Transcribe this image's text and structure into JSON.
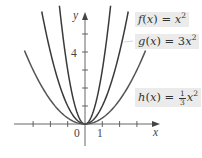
{
  "chart_data": {
    "type": "line",
    "title": "",
    "xlabel": "x",
    "ylabel": "y",
    "x_tick_labels": [
      "0",
      "1"
    ],
    "y_tick_labels": [
      "4"
    ],
    "x_ticks": [
      -3,
      -2,
      -1,
      0,
      1,
      2,
      3
    ],
    "y_ticks": [
      1,
      2,
      3,
      4,
      5
    ],
    "xlim": [
      -3.7,
      4.1
    ],
    "ylim": [
      -1,
      6.2
    ],
    "grid": false,
    "legend_position": "inline-labels-right",
    "series": [
      {
        "name": "f(x) = x^2",
        "formula": "x^2",
        "coef": 1,
        "x_range": [
          -2.5,
          2.5
        ],
        "color": "#3a3a3a",
        "label_text": {
          "fn": "f",
          "arg": "x",
          "rhs": "x",
          "exp": "2"
        }
      },
      {
        "name": "g(x) = 3x^2",
        "formula": "3x^2",
        "coef": 3,
        "x_range": [
          -1.48,
          1.48
        ],
        "color": "#3a3a3a",
        "label_text": {
          "fn": "g",
          "arg": "x",
          "rhs": "3x",
          "exp": "2"
        }
      },
      {
        "name": "h(x) = (1/3)x^2",
        "formula": "(1/3)x^2",
        "coef": 0.3333,
        "x_range": [
          -3.5,
          3.5
        ],
        "color": "#555555",
        "label_text": {
          "fn": "h",
          "arg": "x",
          "frac_num": "1",
          "frac_den": "3",
          "rhs": "x",
          "exp": "2"
        }
      }
    ]
  },
  "axes": {
    "x_label": "x",
    "y_label": "y",
    "origin_label": "0",
    "x_one_label": "1",
    "y_four_label": "4"
  },
  "labels": {
    "f": {
      "fn": "f",
      "open": "(",
      "arg": "x",
      "close": ")",
      "eq": " = ",
      "rhs": "x",
      "exp": "2"
    },
    "g": {
      "fn": "g",
      "open": "(",
      "arg": "x",
      "close": ")",
      "eq": " = ",
      "rhs": "3",
      "rhs_var": "x",
      "exp": "2"
    },
    "h": {
      "fn": "h",
      "open": "(",
      "arg": "x",
      "close": ")",
      "eq": " = ",
      "frac_num": "1",
      "frac_den": "3",
      "rhs": "x",
      "exp": "2"
    }
  },
  "colors": {
    "axis": "#555555",
    "curve_dark": "#333333",
    "curve_light": "#5a5a5a",
    "label_bg": "#ebebeb"
  }
}
